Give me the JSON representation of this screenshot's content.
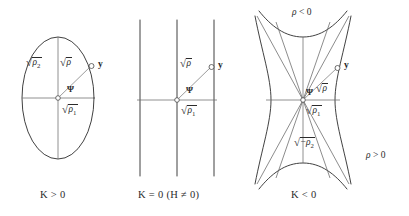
{
  "figure": {
    "name": "conic-sections-curvature-figure",
    "background_color": "#ffffff",
    "curve_color": "#2b2b2b",
    "axis_color": "#6b6b6b",
    "panels": [
      {
        "id": "panel-k-positive",
        "caption": "K > 0",
        "shape": "ellipse",
        "labels": {
          "rho2": "√ρ₂",
          "rho": "√ρ",
          "rho1": "√ρ₁",
          "point_y": "y",
          "angle_psi": "Ψ"
        }
      },
      {
        "id": "panel-k-zero",
        "caption": "K = 0 (H ≠ 0)",
        "shape": "parallel-lines",
        "labels": {
          "rho": "√ρ",
          "rho1": "√ρ₁",
          "point_y": "y",
          "angle_psi": "Ψ"
        }
      },
      {
        "id": "panel-k-negative",
        "caption": "K < 0",
        "shape": "hyperbola",
        "labels": {
          "rho": "√ρ",
          "rho1": "√ρ₁",
          "neg_rho2": "√(−ρ₂)",
          "point_y": "y",
          "angle_psi": "Ψ",
          "region_negative": "ρ < 0",
          "region_positive": "ρ > 0"
        }
      }
    ],
    "captions": {
      "panel1": "K > 0",
      "panel2_a": "K = 0 (H",
      "panel2_b": "≠",
      "panel2_c": "0)",
      "panel3": "K < 0"
    },
    "text": {
      "K": "K",
      "gt": ">",
      "lt": "<",
      "eq": "=",
      "neq": "≠",
      "zero": "0",
      "H": "H",
      "rho_sym": "ρ",
      "psi_sym": "Ψ",
      "y_sym": "y",
      "sub1": "1",
      "sub2": "2",
      "minus": "−",
      "radical": "√"
    }
  }
}
